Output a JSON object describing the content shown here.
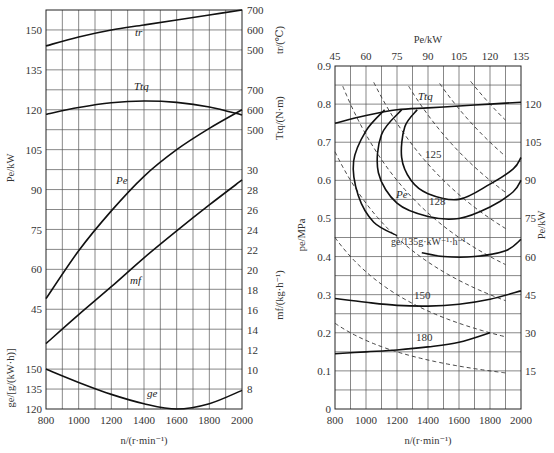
{
  "chart_data": [
    {
      "type": "line",
      "title": "Engine speed characteristic",
      "xlabel": "n/(r·min⁻¹)",
      "x_ticks": [
        800,
        1000,
        1200,
        1400,
        1600,
        1800,
        2000
      ],
      "xlim": [
        800,
        2000
      ],
      "grid": true,
      "left_axes": [
        {
          "label": "Pe/kW",
          "ticks": [
            45,
            60,
            75,
            90,
            105,
            120,
            135,
            150
          ]
        },
        {
          "label": "ge/[g/(kW·h)]",
          "ticks": [
            120,
            135,
            150
          ]
        }
      ],
      "right_axes": [
        {
          "label": "tr/(℃)",
          "ticks": [
            500,
            600,
            700
          ]
        },
        {
          "label": "Ttq/(N·m)",
          "ticks": [
            500,
            600,
            700
          ]
        },
        {
          "label": "mf/(kg·h⁻¹)",
          "ticks": [
            8,
            10,
            12,
            14,
            16,
            18,
            20,
            22,
            24,
            26,
            28,
            30
          ]
        }
      ],
      "series": [
        {
          "name": "tr",
          "label": "tr",
          "x": [
            800,
            1000,
            1200,
            1400,
            1600,
            1800,
            2000
          ],
          "values": [
            520,
            565,
            600,
            625,
            650,
            675,
            700
          ],
          "unit": "℃"
        },
        {
          "name": "Ttq",
          "label": "Ttq",
          "x": [
            800,
            1000,
            1200,
            1400,
            1600,
            1800,
            2000
          ],
          "values": [
            578,
            612,
            636,
            645,
            638,
            615,
            575
          ],
          "unit": "N·m"
        },
        {
          "name": "Pe",
          "label": "Pe",
          "x": [
            800,
            1000,
            1200,
            1400,
            1600,
            1800,
            2000
          ],
          "values": [
            49,
            67,
            82,
            95,
            105,
            113,
            120
          ],
          "unit": "kW"
        },
        {
          "name": "mf",
          "label": "mf",
          "x": [
            800,
            1000,
            1200,
            1400,
            1600,
            1800,
            2000
          ],
          "values": [
            12.6,
            15.5,
            18.3,
            21.2,
            23.9,
            26.5,
            29.0
          ],
          "unit": "kg·h⁻¹"
        },
        {
          "name": "ge",
          "label": "ge",
          "x": [
            800,
            1000,
            1200,
            1400,
            1600,
            1800,
            2000
          ],
          "values": [
            150,
            140,
            131,
            124,
            120,
            124,
            134
          ],
          "unit": "g/(kW·h)"
        }
      ]
    },
    {
      "type": "line",
      "title": "Universal characteristic map",
      "xlabel": "n/(r·min⁻¹)",
      "ylabel": "pe/MPa",
      "top_axis": {
        "label": "Pe/kW",
        "ticks": [
          45,
          60,
          75,
          90,
          105,
          120,
          135
        ]
      },
      "right_axis": {
        "label": "Pe/kW",
        "ticks": [
          15,
          30,
          45,
          60,
          75,
          90,
          105,
          120
        ]
      },
      "x_ticks": [
        800,
        1000,
        1200,
        1400,
        1600,
        1800,
        2000
      ],
      "y_ticks": [
        0,
        0.1,
        0.2,
        0.3,
        0.4,
        0.5,
        0.6,
        0.7,
        0.8,
        0.9
      ],
      "xlim": [
        800,
        2000
      ],
      "ylim": [
        0,
        0.9
      ],
      "grid": true,
      "annotations": [
        "Ttq",
        "Pe",
        "125",
        "128",
        "ge/135g·kW⁻¹·h⁻¹",
        "150",
        "180"
      ],
      "series": [
        {
          "name": "Ttq (full load)",
          "x": [
            800,
            1000,
            1200,
            1400,
            1600,
            1800,
            2000
          ],
          "values": [
            0.75,
            0.77,
            0.785,
            0.79,
            0.795,
            0.8,
            0.805
          ]
        },
        {
          "name": "ge=125 contour",
          "closed": true
        },
        {
          "name": "ge=128 contour",
          "closed": true
        },
        {
          "name": "ge=135 contour",
          "closed": true
        },
        {
          "name": "ge=150",
          "x": [
            800,
            1000,
            1200,
            1400,
            1600,
            1800,
            2000
          ],
          "values": [
            0.29,
            0.28,
            0.272,
            0.27,
            0.275,
            0.288,
            0.31
          ]
        },
        {
          "name": "ge=180",
          "x": [
            800,
            1000,
            1200,
            1400,
            1600,
            1800
          ],
          "values": [
            0.145,
            0.15,
            0.155,
            0.163,
            0.175,
            0.2
          ]
        },
        {
          "name": "Pe iso-power (dashed)",
          "levels_kW": [
            15,
            30,
            45,
            60,
            75,
            90,
            105,
            120
          ]
        }
      ]
    }
  ],
  "labels": {
    "left": {
      "xlabel": "n/(r·min⁻¹)",
      "pe_axis": "Pe/kW",
      "ge_axis": "ge/[g/(kW·h)]",
      "tr_axis": "tr/(℃)",
      "ttq_axis": "Ttq/(N·m)",
      "mf_axis": "mf/(kg·h⁻¹)",
      "curve_tr": "tr",
      "curve_ttq": "Ttq",
      "curve_pe": "Pe",
      "curve_mf": "mf",
      "curve_ge": "ge"
    },
    "right": {
      "xlabel": "n/(r·min⁻¹)",
      "top_label": "Pe/kW",
      "left_label": "pe/MPa",
      "right_label": "Pe/kW",
      "ttq": "Ttq",
      "pe": "Pe",
      "c125": "125",
      "c128": "128",
      "c135": "ge/135g·kW⁻¹·h⁻¹",
      "c150": "150",
      "c180": "180"
    }
  }
}
